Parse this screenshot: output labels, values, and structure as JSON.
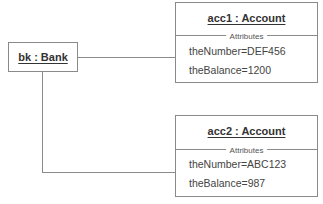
{
  "diagram": {
    "type": "UML object diagram",
    "objects": [
      {
        "id": "bank",
        "title": "bk : Bank"
      },
      {
        "id": "acc1",
        "title": "acc1 : Account",
        "section_label": "Attributes",
        "attributes": [
          "theNumber=DEF456",
          "theBalance=1200"
        ]
      },
      {
        "id": "acc2",
        "title": "acc2 : Account",
        "section_label": "Attributes",
        "attributes": [
          "theNumber=ABC123",
          "theBalance=987"
        ]
      }
    ],
    "links": [
      {
        "from": "bank",
        "to": "acc1"
      },
      {
        "from": "bank",
        "to": "acc2"
      }
    ]
  }
}
